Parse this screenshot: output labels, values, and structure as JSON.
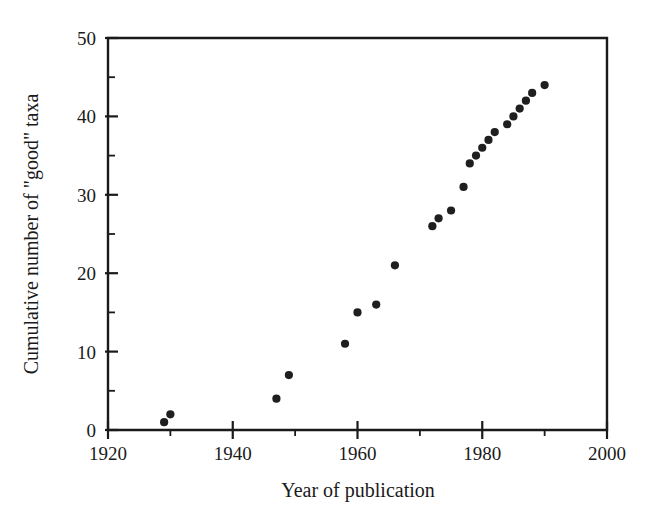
{
  "chart_data": {
    "type": "scatter",
    "title": "",
    "xlabel": "Year of publication",
    "ylabel": "Cumulative number of \"good\" taxa",
    "xlim": [
      1920,
      2000
    ],
    "ylim": [
      0,
      50
    ],
    "grid": false,
    "legend": null,
    "x_ticks_major": [
      1920,
      1940,
      1960,
      1980,
      2000
    ],
    "x_tick_labels": [
      "1920",
      "1940",
      "1960",
      "1980",
      "2000"
    ],
    "x_ticks_minor": [
      1930,
      1950,
      1970,
      1990
    ],
    "y_ticks_major": [
      0,
      10,
      20,
      30,
      40,
      50
    ],
    "y_tick_labels": [
      "0",
      "10",
      "20",
      "30",
      "40",
      "50"
    ],
    "y_ticks_minor": [
      5,
      15,
      25,
      35,
      45
    ],
    "marker": "filled-circle",
    "marker_color": "#1f1f1f",
    "marker_size_px": 5.2,
    "x": [
      1929,
      1930,
      1947,
      1949,
      1958,
      1960,
      1963,
      1966,
      1972,
      1973,
      1975,
      1977,
      1978,
      1979,
      1980,
      1981,
      1982,
      1984,
      1985,
      1986,
      1987,
      1988,
      1990
    ],
    "y": [
      1,
      2,
      4,
      7,
      11,
      15,
      16,
      21,
      26,
      27,
      28,
      31,
      34,
      35,
      36,
      37,
      38,
      39,
      40,
      41,
      42,
      43,
      44
    ],
    "points": [
      {
        "x": 1929,
        "y": 1
      },
      {
        "x": 1930,
        "y": 2
      },
      {
        "x": 1947,
        "y": 4
      },
      {
        "x": 1949,
        "y": 7
      },
      {
        "x": 1958,
        "y": 11
      },
      {
        "x": 1960,
        "y": 15
      },
      {
        "x": 1963,
        "y": 16
      },
      {
        "x": 1966,
        "y": 21
      },
      {
        "x": 1972,
        "y": 26
      },
      {
        "x": 1973,
        "y": 27
      },
      {
        "x": 1975,
        "y": 28
      },
      {
        "x": 1977,
        "y": 31
      },
      {
        "x": 1978,
        "y": 34
      },
      {
        "x": 1979,
        "y": 35
      },
      {
        "x": 1980,
        "y": 36
      },
      {
        "x": 1981,
        "y": 37
      },
      {
        "x": 1982,
        "y": 38
      },
      {
        "x": 1984,
        "y": 39
      },
      {
        "x": 1985,
        "y": 40
      },
      {
        "x": 1986,
        "y": 41
      },
      {
        "x": 1987,
        "y": 42
      },
      {
        "x": 1988,
        "y": 43
      },
      {
        "x": 1990,
        "y": 44
      }
    ]
  }
}
